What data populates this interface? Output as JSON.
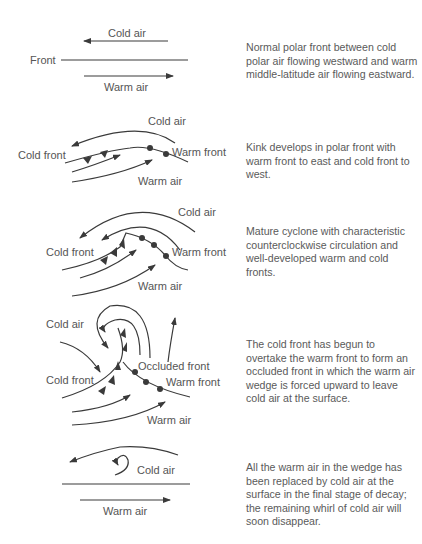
{
  "stages": [
    {
      "labels": {
        "top": "Cold air",
        "left": "Front",
        "bottom": "Warm air"
      },
      "description": "Normal polar front between cold polar air flowing westward and warm middle-latitude air flowing eastward."
    },
    {
      "labels": {
        "top": "Cold air",
        "left": "Cold front",
        "right": "Warm front",
        "bottom": "Warm air"
      },
      "description": "Kink develops in polar front with warm front to east and cold front to west."
    },
    {
      "labels": {
        "top": "Cold air",
        "left": "Cold front",
        "right": "Warm front",
        "bottom": "Warm air"
      },
      "description": "Mature cyclone with characteristic counterclockwise circulation and well-developed warm and cold fronts."
    },
    {
      "labels": {
        "top": "Cold air",
        "left": "Cold front",
        "middle": "Occluded front",
        "right": "Warm front",
        "bottom": "Warm air"
      },
      "description": "The cold front has begun to overtake the warm front to form an occluded front in which the warm air wedge is forced upward to leave cold air at the surface."
    },
    {
      "labels": {
        "top": "Cold air",
        "bottom": "Warm air"
      },
      "description": "All the warm air in the wedge has been replaced by cold air at the surface in the final stage of decay; the remaining whirl of cold air will soon disappear."
    }
  ],
  "colors": {
    "line": "#3a3a3a",
    "text": "#555555"
  }
}
